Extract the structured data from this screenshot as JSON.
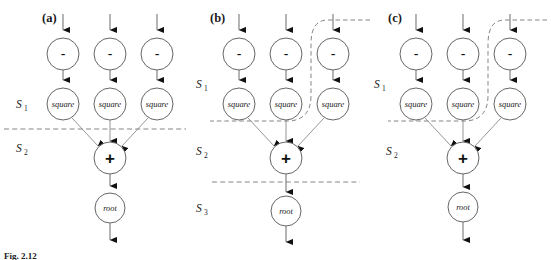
{
  "figure": {
    "caption": "Fig. 2.12",
    "width": 551,
    "height": 260,
    "background_color": "#ffffff",
    "node_stroke_color": "#555555",
    "edge_color": "#777777",
    "dashed_color": "#6f6f6f",
    "text_color": "#1a1a1a"
  },
  "panels": [
    {
      "id": "a",
      "label": "(a)",
      "regions": [
        {
          "name": "S1",
          "base": "S",
          "subscript": "1"
        },
        {
          "name": "S2",
          "base": "S",
          "subscript": "2"
        }
      ],
      "nodes": [
        {
          "id": "a-minus-1",
          "label": "-",
          "kind": "minus"
        },
        {
          "id": "a-minus-2",
          "label": "-",
          "kind": "minus"
        },
        {
          "id": "a-minus-3",
          "label": "-",
          "kind": "minus"
        },
        {
          "id": "a-square-1",
          "label": "square",
          "kind": "square"
        },
        {
          "id": "a-square-2",
          "label": "square",
          "kind": "square"
        },
        {
          "id": "a-square-3",
          "label": "square",
          "kind": "square"
        },
        {
          "id": "a-plus",
          "label": "+",
          "kind": "plus"
        },
        {
          "id": "a-root",
          "label": "root",
          "kind": "root"
        }
      ],
      "boundary_type": "straight-dashed",
      "boundary_count": 1
    },
    {
      "id": "b",
      "label": "(b)",
      "regions": [
        {
          "name": "S1",
          "base": "S",
          "subscript": "1"
        },
        {
          "name": "S2",
          "base": "S",
          "subscript": "2"
        },
        {
          "name": "S3",
          "base": "S",
          "subscript": "3"
        }
      ],
      "nodes": [
        {
          "id": "b-minus-1",
          "label": "-",
          "kind": "minus"
        },
        {
          "id": "b-minus-2",
          "label": "-",
          "kind": "minus"
        },
        {
          "id": "b-minus-3",
          "label": "-",
          "kind": "minus"
        },
        {
          "id": "b-square-1",
          "label": "square",
          "kind": "square"
        },
        {
          "id": "b-square-2",
          "label": "square",
          "kind": "square"
        },
        {
          "id": "b-square-3",
          "label": "square",
          "kind": "square"
        },
        {
          "id": "b-plus",
          "label": "+",
          "kind": "plus"
        },
        {
          "id": "b-root",
          "label": "root",
          "kind": "root"
        }
      ],
      "boundary_type": "curved-dashed-plus-straight",
      "boundary_count": 2
    },
    {
      "id": "c",
      "label": "(c)",
      "regions": [
        {
          "name": "S1",
          "base": "S",
          "subscript": "1"
        },
        {
          "name": "S2",
          "base": "S",
          "subscript": "2"
        }
      ],
      "nodes": [
        {
          "id": "c-minus-1",
          "label": "-",
          "kind": "minus"
        },
        {
          "id": "c-minus-2",
          "label": "-",
          "kind": "minus"
        },
        {
          "id": "c-minus-3",
          "label": "-",
          "kind": "minus"
        },
        {
          "id": "c-square-1",
          "label": "square",
          "kind": "square"
        },
        {
          "id": "c-square-2",
          "label": "square",
          "kind": "square"
        },
        {
          "id": "c-square-3",
          "label": "square",
          "kind": "square"
        },
        {
          "id": "c-plus",
          "label": "+",
          "kind": "plus"
        },
        {
          "id": "c-root",
          "label": "root",
          "kind": "root"
        }
      ],
      "boundary_type": "curved-dashed",
      "boundary_count": 1
    }
  ],
  "labels": {
    "minus": "-",
    "plus": "+",
    "square": "square",
    "root": "root",
    "panel_a": "(a)",
    "panel_b": "(b)",
    "panel_c": "(c)",
    "s_base": "S",
    "s1_sub": "1",
    "s2_sub": "2",
    "s3_sub": "3",
    "caption": "Fig. 2.12"
  }
}
